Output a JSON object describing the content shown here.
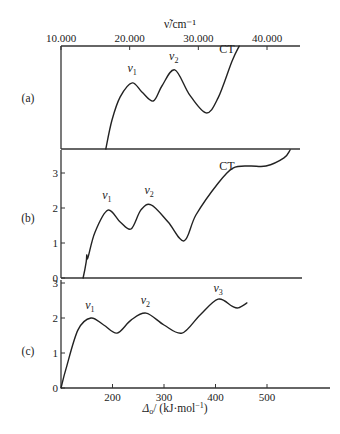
{
  "chart_data": {
    "type": "line",
    "top_axis": {
      "label": "ν̃/cm⁻¹",
      "ticks": [
        10000,
        20000,
        30000,
        40000
      ],
      "tick_labels": [
        "10.000",
        "20.000",
        "30.000",
        "40.000"
      ]
    },
    "bottom_axis": {
      "label": "Δo/ (kJ·mol⁻¹)",
      "ticks": [
        200,
        300,
        400,
        500
      ],
      "tick_labels": [
        "200",
        "300",
        "400",
        "500"
      ],
      "xlim": [
        100,
        560
      ]
    },
    "panels": [
      {
        "id": "a",
        "label": "(a)",
        "ylim": [
          0,
          2.94
        ],
        "yticks": [],
        "annotations": [
          {
            "text": "ν1",
            "base": "v",
            "sub": "1",
            "x": 238,
            "y": 2.2
          },
          {
            "text": "ν2",
            "base": "v",
            "sub": "2",
            "x": 319,
            "y": 2.55
          },
          {
            "text": "CT",
            "base": "CT",
            "sub": "",
            "x": 422,
            "y": 2.75
          }
        ],
        "x": [
          187,
          199,
          215,
          238,
          257,
          279,
          296,
          321,
          350,
          382,
          405,
          432,
          446
        ],
        "y": [
          0,
          0.83,
          1.49,
          1.89,
          1.63,
          1.37,
          1.8,
          2.26,
          1.54,
          1.03,
          1.46,
          2.51,
          2.94
        ]
      },
      {
        "id": "b",
        "label": "(b)",
        "ylim": [
          0,
          3.66
        ],
        "yticks": [
          0,
          1,
          2,
          3
        ],
        "annotations": [
          {
            "text": "ν1",
            "base": "v",
            "sub": "1",
            "x": 189,
            "y": 2.25
          },
          {
            "text": "ν2",
            "base": "v",
            "sub": "2",
            "x": 271,
            "y": 2.4
          },
          {
            "text": "CT",
            "base": "CT",
            "sub": "",
            "x": 422,
            "y": 3.1
          }
        ],
        "x": [
          143,
          149,
          150,
          152,
          166,
          191,
          215,
          236,
          255,
          275,
          308,
          339,
          362,
          405,
          434,
          467,
          498,
          533,
          545
        ],
        "y": [
          0,
          0.46,
          0.66,
          0.57,
          1.31,
          1.94,
          1.6,
          1.4,
          1.94,
          2.09,
          1.6,
          1.06,
          1.8,
          2.71,
          3.14,
          3.2,
          3.2,
          3.43,
          3.66
        ]
      },
      {
        "id": "c",
        "label": "(c)",
        "ylim": [
          0,
          3.1
        ],
        "yticks": [
          0,
          1,
          2,
          3
        ],
        "annotations": [
          {
            "text": "ν1",
            "base": "v",
            "sub": "1",
            "x": 156,
            "y": 2.25
          },
          {
            "text": "ν2",
            "base": "v",
            "sub": "2",
            "x": 264,
            "y": 2.4
          },
          {
            "text": "ν3",
            "base": "v",
            "sub": "3",
            "x": 405,
            "y": 2.75
          }
        ],
        "x": [
          100,
          110,
          133,
          158,
          183,
          209,
          236,
          265,
          300,
          335,
          370,
          405,
          432,
          444,
          461
        ],
        "y": [
          0,
          0.57,
          1.66,
          2.0,
          1.8,
          1.57,
          1.94,
          2.14,
          1.8,
          1.57,
          2.09,
          2.54,
          2.34,
          2.29,
          2.43
        ]
      }
    ]
  }
}
